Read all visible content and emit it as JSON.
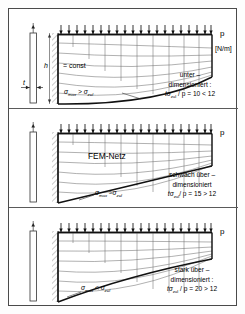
{
  "figure": {
    "title_hidden": "",
    "unit_label": "[N/m]",
    "load_label": "p",
    "mesh_label": "FEM-Netz",
    "height_label": "h",
    "height_eq": "= const",
    "thickness_label": "t"
  },
  "panels": [
    {
      "id": "panel-under",
      "load_label": "p",
      "unit_label": "[N/m]",
      "stress_label_prefix": "σ",
      "stress_label": "σmax > σzul",
      "stress_sym": "σ",
      "stress_sub1": "max",
      "stress_rel": ">",
      "stress_sub2": "zul",
      "note_line1": "unter –",
      "note_line2": "dimensioniert :",
      "note_line3_sym": "tσ",
      "note_line3_sub": "zul",
      "note_line3_rest": "/ p = 10 < 12",
      "show_unit": true,
      "show_h": true,
      "show_mesh_label": false,
      "tip_ratio": 0.44
    },
    {
      "id": "panel-slightly-over",
      "load_label": "p",
      "unit_label": "",
      "stress_label": "σmax ≈ σzul",
      "stress_sym": "σ",
      "stress_sub1": "max",
      "stress_rel": "≈",
      "stress_sub2": "zul",
      "note_line1": "schwach über –",
      "note_line2": "dimensioniert",
      "note_line3_sym": "tσ",
      "note_line3_sub": "zul",
      "note_line3_rest": "/ p = 15 > 12",
      "show_unit": false,
      "show_h": false,
      "show_mesh_label": true,
      "tip_ratio": 0.33
    },
    {
      "id": "panel-strongly-over",
      "load_label": "p",
      "unit_label": "",
      "stress_label": "σmax < σzul",
      "stress_sym": "σ",
      "stress_sub1": "max",
      "stress_rel": "<",
      "stress_sub2": "zul",
      "note_line1": "stark über –",
      "note_line2": "dimensioniert :",
      "note_line3_sym": "tσ",
      "note_line3_sub": "zul",
      "note_line3_rest": "/ p = 20 > 12",
      "show_unit": false,
      "show_h": false,
      "show_mesh_label": false,
      "tip_ratio": 0.23
    }
  ],
  "colors": {
    "frame": "#4a4a4a",
    "ink": "#111111",
    "mesh": "#6a6a6a",
    "hatch": "#808080"
  }
}
